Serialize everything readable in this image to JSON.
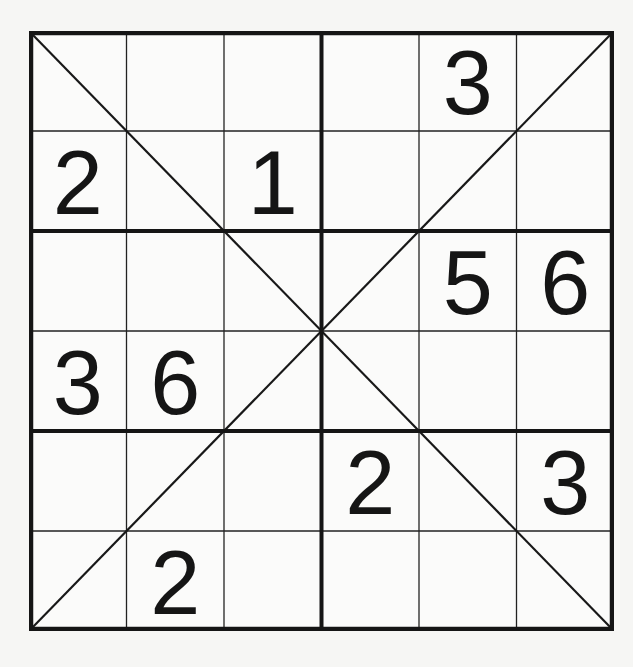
{
  "puzzle": {
    "type": "x-sudoku",
    "size": 6,
    "box_rows": 2,
    "box_cols": 3,
    "diagonals": true,
    "colors": {
      "background": "#f6f6f4",
      "line": "#151515",
      "digit": "#151515"
    },
    "grid": [
      [
        "",
        "",
        "",
        "",
        "3",
        ""
      ],
      [
        "2",
        "",
        "1",
        "",
        "",
        ""
      ],
      [
        "",
        "",
        "",
        "",
        "5",
        "6"
      ],
      [
        "3",
        "6",
        "",
        "",
        "",
        ""
      ],
      [
        "",
        "",
        "",
        "2",
        "",
        "3"
      ],
      [
        "",
        "2",
        "",
        "",
        "",
        ""
      ]
    ]
  }
}
